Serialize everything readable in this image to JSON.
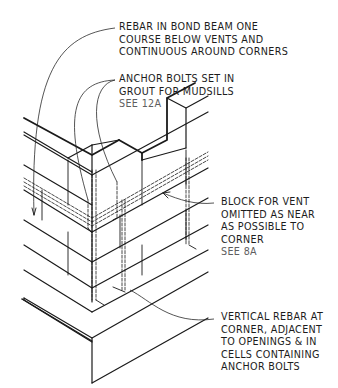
{
  "diagram": {
    "colors": {
      "ink": "#1a1a1a",
      "reference_text": "#5e5e5e",
      "background": "#ffffff"
    },
    "callouts": [
      {
        "id": "bond-beam-rebar",
        "lines": [
          "REBAR IN BOND BEAM ONE",
          "COURSE BELOW VENTS AND",
          "CONTINUOUS AROUND CORNERS"
        ],
        "reference": ""
      },
      {
        "id": "anchor-bolts",
        "lines": [
          "ANCHOR BOLTS SET IN",
          "GROUT FOR MUDSILLS"
        ],
        "reference": "SEE 12A"
      },
      {
        "id": "vent-block",
        "lines": [
          "BLOCK FOR VENT",
          "OMITTED AS NEAR",
          "AS POSSIBLE TO",
          "CORNER"
        ],
        "reference": "SEE 8A"
      },
      {
        "id": "vertical-rebar",
        "lines": [
          "VERTICAL REBAR AT",
          "CORNER, ADJACENT",
          "TO OPENINGS & IN",
          "CELLS CONTAINING",
          "ANCHOR BOLTS"
        ],
        "reference": ""
      }
    ]
  }
}
